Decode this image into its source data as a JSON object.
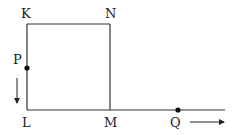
{
  "diagram": {
    "labels": {
      "K": "K",
      "N": "N",
      "P": "P",
      "L": "L",
      "M": "M",
      "Q": "Q"
    },
    "colors": {
      "line": "#333333",
      "text": "#222222",
      "background": "#ffffff"
    }
  }
}
